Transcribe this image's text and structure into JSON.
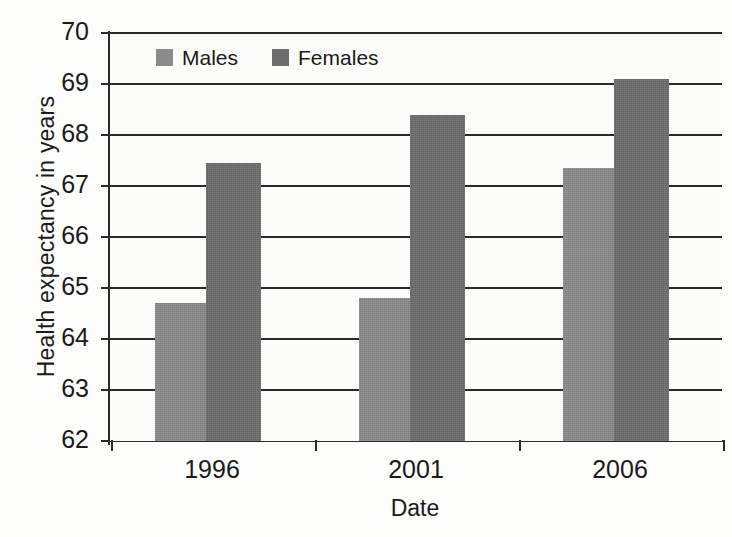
{
  "chart_data": {
    "type": "bar",
    "title": "",
    "subtitle": "",
    "xlabel": "Date",
    "ylabel": "Health expectancy in years",
    "categories": [
      "1996",
      "2001",
      "2006"
    ],
    "series": [
      {
        "name": "Males",
        "values": [
          64.7,
          64.8,
          67.35
        ],
        "color": "#8b8b8b"
      },
      {
        "name": "Females",
        "values": [
          67.45,
          68.4,
          69.1
        ],
        "color": "#6d6d6d"
      }
    ],
    "ylim": [
      62,
      70
    ],
    "yticks": [
      62,
      63,
      64,
      65,
      66,
      67,
      68,
      69,
      70
    ],
    "ytick_labels": [
      "62",
      "63",
      "64",
      "65",
      "66",
      "67",
      "68",
      "69",
      "70"
    ],
    "grid": true,
    "grid_axis": "y",
    "legend_position": "inside-top-left",
    "annotations": []
  },
  "legend": {
    "entries": [
      {
        "label": "Males",
        "swatch": "males-color-swatch"
      },
      {
        "label": "Females",
        "swatch": "females-color-swatch"
      }
    ]
  },
  "axes": {
    "y_title": "Health expectancy in years",
    "x_title": "Date"
  },
  "colors": {
    "males": "#8b8b8b",
    "females": "#6d6d6d",
    "axis": "#2a2a2a",
    "background": "#fdfdfb"
  }
}
